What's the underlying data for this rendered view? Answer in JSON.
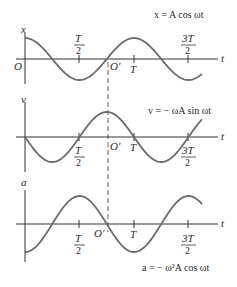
{
  "diagram": {
    "panels": [
      {
        "id": "displacement",
        "axis_label": "x",
        "origin_label": "O",
        "equation": "x = A cos ωt",
        "function": "cos",
        "sign": 1
      },
      {
        "id": "velocity",
        "axis_label": "v",
        "equation": "v = − ωA sin ωt",
        "function": "sin",
        "sign": -1
      },
      {
        "id": "acceleration",
        "axis_label": "a",
        "equation": "a = − ω²A cos ωt",
        "function": "cos",
        "sign": -1
      }
    ],
    "time_axis_label": "t",
    "ticks": [
      {
        "num": "T",
        "den": "2"
      },
      {
        "single": "T"
      },
      {
        "num": "3T",
        "den": "2"
      }
    ],
    "shifted_origin_label": "O′",
    "colors": {
      "curve": "#6b6b6b",
      "axis": "#333333",
      "text": "#2a2a2a"
    }
  }
}
